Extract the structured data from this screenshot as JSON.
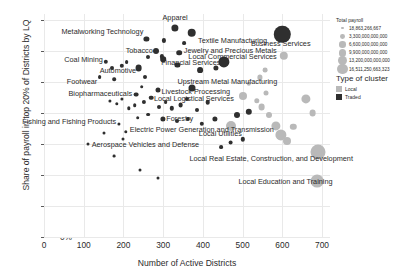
{
  "chart_data": {
    "type": "scatter",
    "title": "",
    "xlabel": "Number of Active Districts",
    "ylabel": "Share of payroll in top 20% of Districts by LQ",
    "xlim": [
      0,
      720
    ],
    "ylim": [
      0,
      72
    ],
    "xticks": [
      0,
      100,
      200,
      300,
      400,
      500,
      600,
      700
    ],
    "yticks": [
      "0%",
      "10%",
      "20%",
      "30%",
      "40%",
      "50%",
      "60%",
      "70%"
    ],
    "ytick_values": [
      0,
      10,
      20,
      30,
      40,
      50,
      60,
      70
    ],
    "grid": true,
    "legend_position": "right",
    "size_encodes": "Total payroll",
    "color_encodes": "Type of cluster",
    "points": [
      {
        "label": "Apparel",
        "x": 330,
        "y": 67.5,
        "size": 3.6,
        "type": "traded",
        "lx": 330,
        "ly": 71.0,
        "align": "center"
      },
      {
        "label": "Metalworking Technology",
        "x": 258,
        "y": 64.0,
        "size": 2.6,
        "type": "traded",
        "lx": 250,
        "ly": 66.5,
        "align": "right"
      },
      {
        "label": "Textile Manufacturing",
        "x": 372,
        "y": 66.0,
        "size": 4.3,
        "type": "traded",
        "lx": 388,
        "ly": 63.5,
        "align": "left"
      },
      {
        "label": "Tobacco",
        "x": 282,
        "y": 60.0,
        "size": 3.0,
        "type": "traded",
        "lx": 274,
        "ly": 60.5,
        "align": "right"
      },
      {
        "label": "Jewelry and Precious Metals",
        "x": 340,
        "y": 59.5,
        "size": 2.8,
        "type": "traded",
        "lx": 352,
        "ly": 60.5,
        "align": "left"
      },
      {
        "label": "Financial Services",
        "x": 452,
        "y": 56.5,
        "size": 5.6,
        "type": "traded",
        "lx": 444,
        "ly": 56.5,
        "align": "right"
      },
      {
        "label": "Business Services",
        "x": 600,
        "y": 65.5,
        "size": 8.2,
        "type": "traded",
        "lx": 596,
        "ly": 62.5,
        "align": "center"
      },
      {
        "label": "Local Commercial Services",
        "x": 604,
        "y": 58.5,
        "size": 4.2,
        "type": "local",
        "lx": 586,
        "ly": 58.5,
        "align": "right"
      },
      {
        "label": "Coal Mining",
        "x": 155,
        "y": 56.5,
        "size": 2.2,
        "type": "traded",
        "lx": 148,
        "ly": 57.5,
        "align": "right"
      },
      {
        "label": "Automotive",
        "x": 238,
        "y": 54.5,
        "size": 3.4,
        "type": "traded",
        "lx": 232,
        "ly": 54.0,
        "align": "right"
      },
      {
        "label": "Footwear",
        "x": 140,
        "y": 51.5,
        "size": 1.9,
        "type": "traded",
        "lx": 134,
        "ly": 50.5,
        "align": "right"
      },
      {
        "label": "Upstream Metal Manufacturing",
        "x": 372,
        "y": 48.0,
        "size": 3.5,
        "type": "traded",
        "lx": 336,
        "ly": 50.5,
        "align": "left"
      },
      {
        "label": "Biopharmaceuticals",
        "x": 232,
        "y": 46.0,
        "size": 2.4,
        "type": "traded",
        "lx": 222,
        "ly": 46.5,
        "align": "right"
      },
      {
        "label": "Livestock Processing",
        "x": 288,
        "y": 47.5,
        "size": 2.5,
        "type": "traded",
        "lx": 296,
        "ly": 47.0,
        "align": "left"
      },
      {
        "label": "Local Logistical Services",
        "x": 500,
        "y": 45.5,
        "size": 4.0,
        "type": "local",
        "lx": 478,
        "ly": 45.0,
        "align": "right"
      },
      {
        "label": "Forestry",
        "x": 300,
        "y": 38.0,
        "size": 2.6,
        "type": "traded",
        "lx": 308,
        "ly": 38.5,
        "align": "left"
      },
      {
        "label": "Fishing and Fishing Products",
        "x": 188,
        "y": 36.5,
        "size": 1.6,
        "type": "traded",
        "lx": 182,
        "ly": 37.5,
        "align": "right"
      },
      {
        "label": "Electric Power Generation and Transmission",
        "x": 206,
        "y": 34.0,
        "size": 1.7,
        "type": "traded",
        "lx": 216,
        "ly": 35.0,
        "align": "left"
      },
      {
        "label": "Local Utilities",
        "x": 470,
        "y": 36.0,
        "size": 5.0,
        "type": "local",
        "lx": 444,
        "ly": 33.5,
        "align": "center"
      },
      {
        "label": "Aerospace Vehicles and Defense",
        "x": 112,
        "y": 30.0,
        "size": 1.5,
        "type": "traded",
        "lx": 120,
        "ly": 30.0,
        "align": "left"
      },
      {
        "label": "Local Real Estate, Construction, and Development",
        "x": 690,
        "y": 27.5,
        "size": 7.5,
        "type": "local",
        "lx": 572,
        "ly": 25.5,
        "align": "center"
      },
      {
        "label": "Local Education and Training",
        "x": 688,
        "y": 18.0,
        "size": 6.4,
        "type": "local",
        "lx": 608,
        "ly": 18.0,
        "align": "center"
      }
    ],
    "unlabeled_points": [
      {
        "x": 302,
        "y": 63.5,
        "size": 2.1,
        "type": "traded"
      },
      {
        "x": 352,
        "y": 62.5,
        "size": 1.9,
        "type": "traded"
      },
      {
        "x": 300,
        "y": 57.5,
        "size": 2.8,
        "type": "traded"
      },
      {
        "x": 296,
        "y": 58.3,
        "size": 2.1,
        "type": "traded"
      },
      {
        "x": 262,
        "y": 58.0,
        "size": 2.0,
        "type": "traded"
      },
      {
        "x": 208,
        "y": 56.5,
        "size": 1.9,
        "type": "traded"
      },
      {
        "x": 196,
        "y": 55.2,
        "size": 2.2,
        "type": "traded"
      },
      {
        "x": 170,
        "y": 54.5,
        "size": 2.0,
        "type": "traded"
      },
      {
        "x": 336,
        "y": 55.5,
        "size": 2.6,
        "type": "traded"
      },
      {
        "x": 392,
        "y": 54.0,
        "size": 2.9,
        "type": "traded"
      },
      {
        "x": 432,
        "y": 54.5,
        "size": 2.6,
        "type": "traded"
      },
      {
        "x": 176,
        "y": 51.0,
        "size": 1.8,
        "type": "traded"
      },
      {
        "x": 254,
        "y": 51.5,
        "size": 2.0,
        "type": "traded"
      },
      {
        "x": 246,
        "y": 48.5,
        "size": 1.8,
        "type": "traded"
      },
      {
        "x": 270,
        "y": 45.0,
        "size": 2.3,
        "type": "traded"
      },
      {
        "x": 252,
        "y": 43.5,
        "size": 2.1,
        "type": "traded"
      },
      {
        "x": 228,
        "y": 42.5,
        "size": 1.8,
        "type": "traded"
      },
      {
        "x": 214,
        "y": 41.5,
        "size": 1.7,
        "type": "traded"
      },
      {
        "x": 196,
        "y": 44.5,
        "size": 1.6,
        "type": "traded"
      },
      {
        "x": 184,
        "y": 43.0,
        "size": 1.7,
        "type": "traded"
      },
      {
        "x": 166,
        "y": 44.0,
        "size": 1.6,
        "type": "traded"
      },
      {
        "x": 290,
        "y": 42.0,
        "size": 2.0,
        "type": "traded"
      },
      {
        "x": 306,
        "y": 43.5,
        "size": 1.9,
        "type": "traded"
      },
      {
        "x": 322,
        "y": 41.5,
        "size": 2.2,
        "type": "traded"
      },
      {
        "x": 344,
        "y": 42.5,
        "size": 2.4,
        "type": "traded"
      },
      {
        "x": 360,
        "y": 44.5,
        "size": 2.1,
        "type": "traded"
      },
      {
        "x": 386,
        "y": 41.0,
        "size": 2.0,
        "type": "traded"
      },
      {
        "x": 412,
        "y": 43.5,
        "size": 2.3,
        "type": "traded"
      },
      {
        "x": 262,
        "y": 39.5,
        "size": 1.9,
        "type": "traded"
      },
      {
        "x": 236,
        "y": 38.5,
        "size": 1.8,
        "type": "traded"
      },
      {
        "x": 334,
        "y": 37.5,
        "size": 2.0,
        "type": "traded"
      },
      {
        "x": 362,
        "y": 38.0,
        "size": 2.1,
        "type": "traded"
      },
      {
        "x": 398,
        "y": 36.5,
        "size": 2.2,
        "type": "traded"
      },
      {
        "x": 430,
        "y": 38.0,
        "size": 2.6,
        "type": "traded"
      },
      {
        "x": 486,
        "y": 39.5,
        "size": 3.0,
        "type": "traded"
      },
      {
        "x": 516,
        "y": 40.5,
        "size": 3.2,
        "type": "traded"
      },
      {
        "x": 536,
        "y": 44.0,
        "size": 2.7,
        "type": "local"
      },
      {
        "x": 548,
        "y": 42.0,
        "size": 3.4,
        "type": "local"
      },
      {
        "x": 560,
        "y": 46.5,
        "size": 2.5,
        "type": "local"
      },
      {
        "x": 566,
        "y": 39.5,
        "size": 3.0,
        "type": "local"
      },
      {
        "x": 584,
        "y": 36.0,
        "size": 4.6,
        "type": "local"
      },
      {
        "x": 596,
        "y": 33.0,
        "size": 5.6,
        "type": "local"
      },
      {
        "x": 612,
        "y": 31.0,
        "size": 4.0,
        "type": "local"
      },
      {
        "x": 628,
        "y": 35.5,
        "size": 3.2,
        "type": "local"
      },
      {
        "x": 544,
        "y": 51.5,
        "size": 2.6,
        "type": "local"
      },
      {
        "x": 556,
        "y": 54.0,
        "size": 2.4,
        "type": "local"
      },
      {
        "x": 516,
        "y": 49.5,
        "size": 2.2,
        "type": "local"
      },
      {
        "x": 470,
        "y": 30.5,
        "size": 2.4,
        "type": "traded"
      },
      {
        "x": 500,
        "y": 31.5,
        "size": 2.2,
        "type": "traded"
      },
      {
        "x": 446,
        "y": 29.0,
        "size": 1.9,
        "type": "traded"
      },
      {
        "x": 152,
        "y": 33.5,
        "size": 1.5,
        "type": "traded"
      },
      {
        "x": 198,
        "y": 31.5,
        "size": 1.5,
        "type": "traded"
      },
      {
        "x": 176,
        "y": 26.0,
        "size": 1.4,
        "type": "traded"
      },
      {
        "x": 242,
        "y": 21.5,
        "size": 1.5,
        "type": "traded"
      },
      {
        "x": 286,
        "y": 19.0,
        "size": 1.5,
        "type": "traded"
      },
      {
        "x": 660,
        "y": 44.5,
        "size": 4.6,
        "type": "local"
      },
      {
        "x": 676,
        "y": 40.0,
        "size": 3.4,
        "type": "local"
      }
    ]
  },
  "legend_size": {
    "title": "Total payroll",
    "entries": [
      {
        "label": "18,863,266,667",
        "r": 1.2
      },
      {
        "label": "3,300,000,000,000",
        "r": 2.4
      },
      {
        "label": "6,600,000,000,000",
        "r": 3.2
      },
      {
        "label": "9,900,000,000,000",
        "r": 3.9
      },
      {
        "label": "13,200,000,000,000",
        "r": 4.5
      },
      {
        "label": "16,511,250,663,323",
        "r": 5.1
      }
    ]
  },
  "legend_type": {
    "title": "Type of cluster",
    "entries": [
      {
        "label": "Local",
        "color": "#b9b9b9"
      },
      {
        "label": "Traded",
        "color": "#2f2f2f"
      }
    ]
  }
}
